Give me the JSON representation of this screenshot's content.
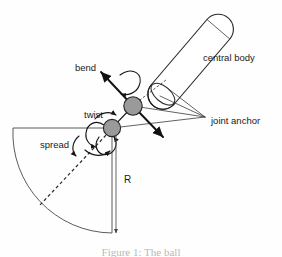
{
  "figure": {
    "background_color": "#fefefe",
    "width": 282,
    "height": 257
  },
  "labels": {
    "central_body": "central body",
    "joint_anchor": "joint anchor",
    "bend": "bend",
    "twist": "twist",
    "spread": "spread",
    "radius": "R"
  },
  "caption": {
    "text": "Figure 1: The ball",
    "note": "cropped at bottom edge of image"
  },
  "colors": {
    "ink": "#1a1a1a",
    "node_fill": "#9a9a9a",
    "node_stroke": "#262626",
    "body_fill": "#ffffff",
    "sector_stroke": "#4a4a4a",
    "caption": "#b9b9b9"
  },
  "geometry": {
    "bend_joint": {
      "cx": 133,
      "cy": 106,
      "r": 9.2
    },
    "twist_joint": {
      "cx": 112,
      "cy": 128,
      "r": 8.6
    },
    "sector": {
      "apex_x": 112,
      "apex_y": 128,
      "radius": 100
    },
    "dimension_line": {
      "x": 116,
      "y_top": 128,
      "y_bottom": 233
    }
  },
  "icons": {
    "bend_axis": "arrow-up-left-icon",
    "bend_rotation": "curved-rotation-arrow-icon",
    "twist_rotation": "curved-rotation-arrow-icon",
    "spread_rotation": "curved-rotation-arrow-icon",
    "radius_dimension": "double-arrow-vertical-icon"
  }
}
